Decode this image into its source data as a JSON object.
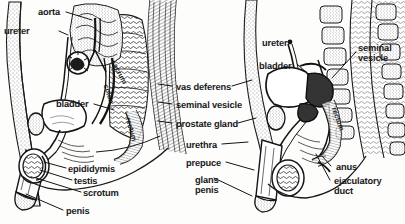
{
  "figure": {
    "ink_color": "#1a1a1a",
    "background_color": "#fdfdfc",
    "panels": [
      "left-overview-sagittal",
      "right-pelvis-sagittal"
    ]
  },
  "labels": {
    "left_panel": [
      {
        "id": "aorta",
        "text": "aorta",
        "x": 38,
        "y": 13,
        "align": "left"
      },
      {
        "id": "ureter",
        "text": "ureter",
        "x": 30,
        "y": 32,
        "align": "left"
      },
      {
        "id": "bladder",
        "text": "bladder",
        "x": 56,
        "y": 105,
        "align": "left"
      },
      {
        "id": "epididymis",
        "text": "epididymis",
        "x": 68,
        "y": 170,
        "align": "left"
      },
      {
        "id": "testis",
        "text": "testis",
        "x": 74,
        "y": 182,
        "align": "left"
      },
      {
        "id": "scrotum",
        "text": "scrotum",
        "x": 83,
        "y": 194,
        "align": "left"
      },
      {
        "id": "penis",
        "text": "penis",
        "x": 66,
        "y": 212,
        "align": "left"
      }
    ],
    "center_column": [
      {
        "id": "vas-deferens",
        "text": "vas deferens",
        "x": 176,
        "y": 88
      },
      {
        "id": "seminal-vesicle",
        "text": "seminal vesicle",
        "x": 176,
        "y": 106
      },
      {
        "id": "prostate-gland",
        "text": "prostate gland",
        "x": 176,
        "y": 125
      },
      {
        "id": "urethra",
        "text": "urethra",
        "x": 186,
        "y": 146
      },
      {
        "id": "prepuce",
        "text": "prepuce",
        "x": 186,
        "y": 164
      },
      {
        "id": "glans-penis",
        "text": "glans",
        "x": 195,
        "y": 181,
        "text2": "penis",
        "y2": 191
      }
    ],
    "right_panel": [
      {
        "id": "ureter-r",
        "text": "ureter",
        "x": 271,
        "y": 44
      },
      {
        "id": "bladder-r",
        "text": "bladder",
        "x": 266,
        "y": 67
      },
      {
        "id": "seminal-vesicle-r",
        "text": "seminal",
        "x": 362,
        "y": 49,
        "text2": "vesicle",
        "y2": 59
      },
      {
        "id": "anus",
        "text": "anus",
        "x": 353,
        "y": 168
      },
      {
        "id": "ejaculatory-duct",
        "text": "ejaculatory",
        "x": 337,
        "y": 182,
        "text2": "duct",
        "y2": 192
      }
    ],
    "internal_left": [
      {
        "id": "sacrum",
        "text": "sacrum",
        "x": 113,
        "y": 62,
        "rotate": 62
      },
      {
        "id": "colon",
        "text": "colon",
        "x": 108,
        "y": 85,
        "rotate": 72
      },
      {
        "id": "rectum",
        "text": "rectum",
        "x": 128,
        "y": 118,
        "rotate": 74
      }
    ],
    "internal_right": [
      {
        "id": "rectum-r",
        "text": "rectum",
        "x": 334,
        "y": 108,
        "rotate": 70
      }
    ]
  }
}
